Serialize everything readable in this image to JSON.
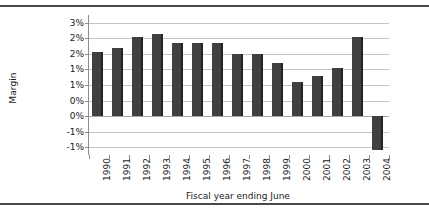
{
  "chart_data": {
    "type": "bar",
    "title": "",
    "xlabel": "Fiscal year ending June",
    "ylabel": "Margin",
    "categories": [
      "1990",
      "1991",
      "1992",
      "1993",
      "1994",
      "1995",
      "1996",
      "1997",
      "1998",
      "1999",
      "2000",
      "2001",
      "2002",
      "2003",
      "2004"
    ],
    "values": [
      2.05,
      2.2,
      2.55,
      2.65,
      2.35,
      2.35,
      2.35,
      2.0,
      2.0,
      1.7,
      1.1,
      1.3,
      1.55,
      2.55,
      -1.1
    ],
    "values_display": [
      "2.05%",
      "2.20%",
      "2.55%",
      "2.65%",
      "2.35%",
      "2.35%",
      "2.35%",
      "2.00%",
      "2.00%",
      "1.70%",
      "1.10%",
      "1.30%",
      "1.55%",
      "2.55%",
      "-1.10%"
    ],
    "ylim": [
      -1.25,
      3.25
    ],
    "ytick_values": [
      3.0,
      2.5,
      2.0,
      1.5,
      1.0,
      0.5,
      0.0,
      -0.5,
      -1.0
    ],
    "ytick_labels": [
      "3%",
      "2%",
      "2%",
      "1%",
      "1%",
      "0%",
      "0%",
      "-1%",
      "-1%"
    ],
    "grid": true,
    "legend": "none",
    "series_color": "#404040",
    "gridline_color": "#c4c4c4",
    "axis_color": "#8c8c8c"
  },
  "axes": {
    "y_title": "Margin",
    "x_title": "Fiscal year ending June"
  }
}
